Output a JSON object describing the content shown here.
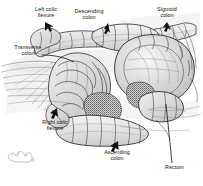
{
  "figure": {
    "background_color": "#ffffff",
    "ink_color": "#2a2a2a",
    "label_color": "#111111",
    "width": 203,
    "height": 186
  },
  "labels": [
    {
      "id": "left-colic-flexure",
      "text": "Left colic\nflexure",
      "pointer": "arrow",
      "x": 27,
      "y": 6
    },
    {
      "id": "descending-colon",
      "text": "Descending\ncolon",
      "pointer": "arrow",
      "x": 66,
      "y": 8
    },
    {
      "id": "sigmoid-colon",
      "text": "Sigmoid\ncolon",
      "pointer": "arrow",
      "x": 146,
      "y": 6
    },
    {
      "id": "transverse-colon",
      "text": "Transverse\ncolon",
      "pointer": "leader-line",
      "x": 6,
      "y": 44
    },
    {
      "id": "right-colic-flexure",
      "text": "Right colic\nflexure",
      "pointer": "arrow",
      "x": 33,
      "y": 119
    },
    {
      "id": "ascending-colon",
      "text": "Ascending\ncolon",
      "pointer": "arrow",
      "x": 93,
      "y": 149
    },
    {
      "id": "rectum",
      "text": "Rectum",
      "pointer": "leader-line",
      "x": 165,
      "y": 164
    }
  ],
  "structures": [
    {
      "id": "transverse-colon-body",
      "description": "horizontal haustrated colon segment across upper middle"
    },
    {
      "id": "descending-colon-body",
      "description": "colon descending at upper right of transverse segment"
    },
    {
      "id": "sigmoid-colon-loop",
      "description": "large rounded sigmoid loop at right"
    },
    {
      "id": "ascending-colon-body",
      "description": "colon rising at lower centre"
    },
    {
      "id": "rectum-body",
      "description": "terminal segment at lower right"
    },
    {
      "id": "mesentery-fan",
      "description": "fanned mesenteric vessels at left"
    },
    {
      "id": "small-bowel-mass",
      "description": "coiled small intestine mass at centre"
    },
    {
      "id": "corner-sketch",
      "description": "faint small sketch mark at lower left"
    }
  ]
}
